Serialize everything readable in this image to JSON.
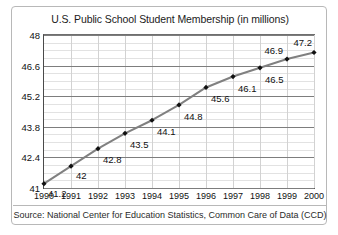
{
  "chart_data": {
    "type": "line",
    "title": "U.S. Public School Student Membership (in millions)",
    "xlabel": "",
    "ylabel": "",
    "categories": [
      "1990",
      "1991",
      "1992",
      "1993",
      "1994",
      "1995",
      "1996",
      "1997",
      "1998",
      "1999",
      "2000"
    ],
    "x": [
      1990,
      1991,
      1992,
      1993,
      1994,
      1995,
      1996,
      1997,
      1998,
      1999,
      2000
    ],
    "values": [
      41.2,
      42,
      42.8,
      43.5,
      44.1,
      44.8,
      45.6,
      46.1,
      46.5,
      46.9,
      47.2
    ],
    "point_labels": [
      "41.2",
      "42",
      "42.8",
      "43.5",
      "44.1",
      "44.8",
      "45.6",
      "46.1",
      "46.5",
      "46.9",
      "47.2"
    ],
    "ylim": [
      41,
      48
    ],
    "yticks": [
      41,
      42.4,
      43.8,
      45.2,
      46.6,
      48
    ],
    "ytick_labels": [
      "41",
      "42.4",
      "43.8",
      "45.2",
      "46.6",
      "48"
    ],
    "y_minor_step": 0.35,
    "grid": true,
    "legend": "none",
    "series_color": "#808080",
    "marker_color": "#111111",
    "marker_shape": "diamond",
    "source": "Source: National Center for Education Statistics, Common Care of Data (CCD)"
  },
  "card": {
    "border_color": "#b8b8b8"
  }
}
